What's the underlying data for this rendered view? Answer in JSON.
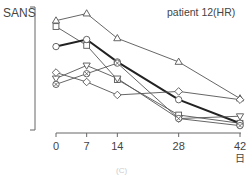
{
  "chart_data": {
    "type": "line",
    "title": "patient 12(HR)",
    "ylabel": "SANS",
    "xlabel": "日",
    "x": [
      0,
      7,
      14,
      28,
      42
    ],
    "x_tick_labels": [
      "0",
      "7",
      "14",
      "28",
      "42"
    ],
    "y_ticks_shown": false,
    "ylim": [
      0,
      100
    ],
    "grid": false,
    "legend": null,
    "series": [
      {
        "name": "triangle-up",
        "marker": "triangle-up",
        "bold": false,
        "values": [
          91,
          97,
          76,
          56,
          25
        ]
      },
      {
        "name": "square",
        "marker": "square",
        "bold": false,
        "values": [
          86,
          70,
          41,
          11,
          4
        ]
      },
      {
        "name": "circle (bold)",
        "marker": "circle",
        "bold": true,
        "values": [
          69,
          75,
          56,
          24,
          4
        ]
      },
      {
        "name": "triangle-down",
        "marker": "triangle-down",
        "bold": false,
        "values": [
          42,
          53,
          42,
          8,
          10
        ]
      },
      {
        "name": "diamond",
        "marker": "diamond",
        "bold": false,
        "values": [
          47,
          39,
          28,
          31,
          24
        ]
      },
      {
        "name": "circle-cross",
        "marker": "circle-cross",
        "bold": false,
        "values": [
          37,
          46,
          55,
          8,
          2
        ]
      }
    ]
  },
  "labels": {
    "ylabel": "SANS",
    "title": "patient 12(HR)",
    "xunit": "日",
    "bottom": "(C)"
  }
}
